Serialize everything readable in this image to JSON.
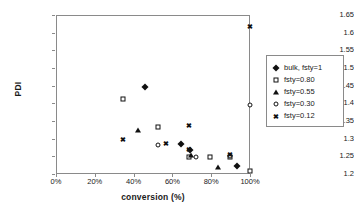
{
  "chart_data": {
    "type": "scatter",
    "title": "",
    "xlabel": "conversion (%)",
    "ylabel": "PDI",
    "xlim": [
      0,
      100
    ],
    "ylim": [
      1.2,
      1.65
    ],
    "grid": false,
    "legend_position": "right",
    "xticks": [
      "0%",
      "20%",
      "40%",
      "60%",
      "80%",
      "100%"
    ],
    "xtick_values": [
      0,
      20,
      40,
      60,
      80,
      100
    ],
    "yticks": [
      "1.2",
      "1.25",
      "1.3",
      "1.35",
      "1.4",
      "1.45",
      "1.5",
      "1.55",
      "1.6",
      "1.65"
    ],
    "ytick_values": [
      1.2,
      1.25,
      1.3,
      1.35,
      1.4,
      1.45,
      1.5,
      1.55,
      1.6,
      1.65
    ],
    "series": [
      {
        "name": "bulk, fsty=1",
        "marker": "filled-diamond",
        "points": [
          {
            "x": 46.0,
            "y": 1.445
          },
          {
            "x": 64.5,
            "y": 1.284
          },
          {
            "x": 69.0,
            "y": 1.268
          },
          {
            "x": 93.5,
            "y": 1.224
          }
        ]
      },
      {
        "name": "fsty=0.80",
        "marker": "open-square",
        "points": [
          {
            "x": 34.5,
            "y": 1.412
          },
          {
            "x": 52.5,
            "y": 1.333
          },
          {
            "x": 68.5,
            "y": 1.249
          },
          {
            "x": 79.5,
            "y": 1.247
          },
          {
            "x": 89.5,
            "y": 1.249
          },
          {
            "x": 100.0,
            "y": 1.209
          }
        ]
      },
      {
        "name": "fsty=0.55",
        "marker": "filled-triangle",
        "points": [
          {
            "x": 42.5,
            "y": 1.325
          },
          {
            "x": 69.5,
            "y": 1.255
          },
          {
            "x": 83.5,
            "y": 1.221
          }
        ]
      },
      {
        "name": "fsty=0.30",
        "marker": "open-circle",
        "points": [
          {
            "x": 52.5,
            "y": 1.282
          },
          {
            "x": 72.0,
            "y": 1.249
          },
          {
            "x": 89.5,
            "y": 1.252
          },
          {
            "x": 100.0,
            "y": 1.395
          }
        ]
      },
      {
        "name": "fsty=0.12",
        "marker": "cross",
        "points": [
          {
            "x": 34.5,
            "y": 1.298
          },
          {
            "x": 56.5,
            "y": 1.288
          },
          {
            "x": 68.5,
            "y": 1.34
          },
          {
            "x": 68.5,
            "y": 1.272
          },
          {
            "x": 89.5,
            "y": 1.256
          },
          {
            "x": 100.0,
            "y": 1.62
          }
        ]
      }
    ]
  },
  "legend": {
    "items": [
      {
        "label": "bulk, fsty=1",
        "marker": "filled-diamond"
      },
      {
        "label": "fsty=0.80",
        "marker": "open-square"
      },
      {
        "label": "fsty=0.55",
        "marker": "filled-triangle"
      },
      {
        "label": "fsty=0.30",
        "marker": "open-circle"
      },
      {
        "label": "fsty=0.12",
        "marker": "cross"
      }
    ]
  }
}
